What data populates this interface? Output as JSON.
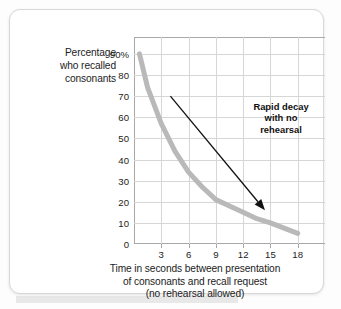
{
  "card": {
    "background": "#ffffff",
    "border_color": "#d8d8d8"
  },
  "chart_data": {
    "type": "line",
    "title": "",
    "subtitle": "",
    "ylabel_lines": [
      "Percentage",
      "who recalled",
      "consonants"
    ],
    "xlabel_lines": [
      "Time in seconds between presentation",
      "of consonants and recall request",
      "(no rehearsal allowed)"
    ],
    "xlabel": "Time in seconds between presentation of consonants and recall request (no rehearsal allowed)",
    "ylabel": "Percentage who recalled consonants",
    "x_ticklabels": [
      "3",
      "6",
      "9",
      "12",
      "15",
      "18"
    ],
    "x_tickvalues": [
      3,
      6,
      9,
      12,
      15,
      18
    ],
    "y_ticklabels": [
      "90%",
      "80",
      "70",
      "60",
      "50",
      "40",
      "30",
      "20",
      "10",
      "0"
    ],
    "y_tickvalues": [
      90,
      80,
      70,
      60,
      50,
      40,
      30,
      20,
      10,
      0
    ],
    "xlim": [
      0,
      21
    ],
    "ylim": [
      0,
      98
    ],
    "grid": true,
    "legend": "none",
    "series": [
      {
        "name": "Percentage recalled",
        "color": "#b9b9b9",
        "linewidth": 5,
        "x": [
          0.6,
          1.5,
          3,
          4.5,
          6,
          7.5,
          9,
          10.5,
          12,
          13.5,
          15,
          16.5,
          18
        ],
        "values": [
          90,
          74,
          57,
          44,
          34,
          27,
          21,
          18,
          15,
          12,
          10,
          7.5,
          5
        ]
      }
    ],
    "annotations": [
      {
        "name": "rapid-decay-note",
        "text_lines": [
          "Rapid decay",
          "with no",
          "rehearsal"
        ],
        "text": "Rapid decay with no rehearsal",
        "arrow_from": {
          "x": 4.0,
          "y": 70
        },
        "arrow_to": {
          "x": 14.4,
          "y": 16
        },
        "color": "#111111"
      }
    ]
  }
}
